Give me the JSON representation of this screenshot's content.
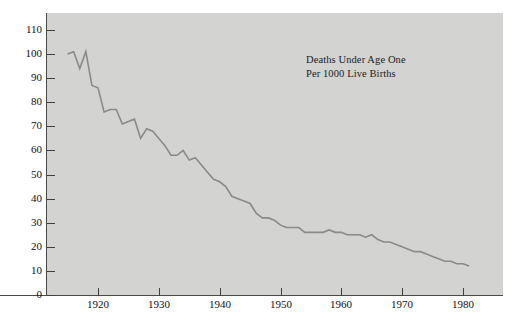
{
  "chart_data": {
    "type": "line",
    "title": "",
    "annotation": [
      "Deaths Under Age One",
      "Per 1000 Live Births"
    ],
    "xlabel": "",
    "ylabel": "",
    "xlim": [
      1915,
      1981
    ],
    "ylim": [
      0,
      110
    ],
    "yticks": [
      0,
      10,
      20,
      30,
      40,
      50,
      60,
      70,
      80,
      90,
      100,
      110
    ],
    "xticks": [
      1920,
      1930,
      1940,
      1950,
      1960,
      1970,
      1980
    ],
    "grid": false,
    "legend": null,
    "line_color": "#8a8a8a",
    "plot_background": "#d3d3d1",
    "page_background": "#ffffff",
    "axis_color": "#4a4a4a",
    "series": [
      {
        "name": "Infant mortality rate",
        "x": [
          1915,
          1916,
          1917,
          1918,
          1919,
          1920,
          1921,
          1922,
          1923,
          1924,
          1925,
          1926,
          1927,
          1928,
          1929,
          1930,
          1931,
          1932,
          1933,
          1934,
          1935,
          1936,
          1937,
          1938,
          1939,
          1940,
          1941,
          1942,
          1943,
          1944,
          1945,
          1946,
          1947,
          1948,
          1949,
          1950,
          1951,
          1952,
          1953,
          1954,
          1955,
          1956,
          1957,
          1958,
          1959,
          1960,
          1961,
          1962,
          1963,
          1964,
          1965,
          1966,
          1967,
          1968,
          1969,
          1970,
          1971,
          1972,
          1973,
          1974,
          1975,
          1976,
          1977,
          1978,
          1979,
          1980,
          1981
        ],
        "values": [
          100,
          101,
          94,
          101,
          87,
          86,
          76,
          77,
          77,
          71,
          72,
          73,
          65,
          69,
          68,
          65,
          62,
          58,
          58,
          60,
          56,
          57,
          54,
          51,
          48,
          47,
          45,
          41,
          40,
          39,
          38,
          34,
          32,
          32,
          31,
          29,
          28,
          28,
          28,
          26,
          26,
          26,
          26,
          27,
          26,
          26,
          25,
          25,
          25,
          24,
          25,
          23,
          22,
          22,
          21,
          20,
          19,
          18,
          18,
          17,
          16,
          15,
          14,
          14,
          13,
          13,
          12
        ]
      }
    ]
  }
}
